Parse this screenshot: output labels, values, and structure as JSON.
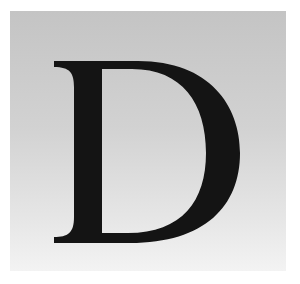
{
  "tile": {
    "letter": "D",
    "letter_color": "#141414",
    "background_top": "#c4c4c4",
    "background_bottom": "#f3f3f3"
  }
}
